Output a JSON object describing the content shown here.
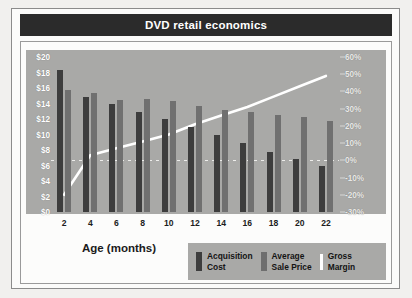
{
  "chart": {
    "title": "DVD retail economics",
    "xaxis_title": "Age (months)"
  },
  "legend": {
    "items": [
      {
        "label": "Acquisition\nCost",
        "icon": "bar-swatch-dark",
        "color": "#3d3d3d"
      },
      {
        "label": "Average\nSale Price",
        "icon": "bar-swatch-gray",
        "color": "#6e6e6e"
      },
      {
        "label": "Gross\nMargin",
        "icon": "line-swatch-white",
        "color": "#ffffff"
      }
    ]
  },
  "chart_data": {
    "type": "bar",
    "title": "DVD retail economics",
    "xlabel": "Age (months)",
    "ylabel": "",
    "categories": [
      2,
      4,
      6,
      8,
      10,
      12,
      14,
      16,
      18,
      20,
      22
    ],
    "x_tick_labels": [
      "2",
      "4",
      "6",
      "8",
      "10",
      "12",
      "14",
      "16",
      "18",
      "20",
      "22"
    ],
    "y_left": {
      "label": "",
      "ylim": [
        0,
        20
      ],
      "ticks": [
        0,
        2,
        4,
        6,
        8,
        10,
        12,
        14,
        16,
        18,
        20
      ],
      "tick_labels": [
        "$0",
        "$2",
        "$4",
        "$6",
        "$8",
        "$10",
        "$12",
        "$14",
        "$16",
        "$18",
        "$20"
      ]
    },
    "y_right": {
      "label": "",
      "ylim": [
        -30,
        60
      ],
      "ticks": [
        -30,
        -20,
        -10,
        0,
        10,
        20,
        30,
        40,
        50,
        60
      ],
      "tick_labels": [
        "-30%",
        "-20%",
        "-10%",
        "0%",
        "10%",
        "20%",
        "30%",
        "40%",
        "50%",
        "60%"
      ]
    },
    "grid": false,
    "legend_position": "bottom-right",
    "series": [
      {
        "name": "Acquisition Cost",
        "type": "bar",
        "axis": "left",
        "color": "#3d3d3d",
        "values": [
          18.3,
          14.8,
          13.9,
          12.9,
          12.0,
          11.0,
          9.9,
          8.9,
          7.8,
          6.9,
          6.0
        ]
      },
      {
        "name": "Average Sale Price",
        "type": "bar",
        "axis": "left",
        "color": "#6e6e6e",
        "values": [
          15.7,
          15.3,
          14.5,
          14.6,
          14.3,
          13.7,
          13.2,
          12.9,
          12.5,
          12.2,
          11.8
        ]
      },
      {
        "name": "Gross Margin",
        "type": "line",
        "axis": "right",
        "color": "#ffffff",
        "values": [
          -20,
          3,
          7,
          11,
          15,
          21,
          26,
          31,
          37,
          43,
          49
        ]
      }
    ]
  }
}
